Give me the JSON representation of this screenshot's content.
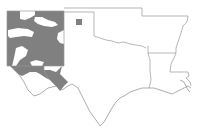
{
  "map": {
    "type": "choropleth",
    "region": "South-central United States",
    "states_outlined": [
      "New Mexico",
      "Texas",
      "Oklahoma",
      "Arkansas",
      "Louisiana"
    ],
    "colors": {
      "shaded": "#808080",
      "unshaded": "#ffffff",
      "border": "#9a9a9a"
    },
    "shaded_areas": [
      "New Mexico counties (majority)",
      "Texas panhandle county (single small square)",
      "Far West Texas counties (El Paso / Hudspeth area)"
    ]
  }
}
